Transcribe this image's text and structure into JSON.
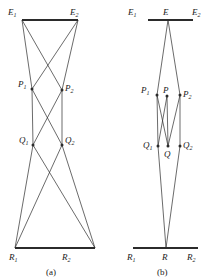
{
  "figure": {
    "background": "#ffffff",
    "ink": "#2b2b2b",
    "panels": [
      {
        "id": "a",
        "caption": "(a)",
        "caption_x": 46,
        "caption_y": 268,
        "bars": [
          {
            "name": "E-bar",
            "x1": 22,
            "y1": 20,
            "x2": 78,
            "y2": 20
          },
          {
            "name": "R-bar",
            "x1": 15,
            "y1": 248,
            "x2": 95,
            "y2": 248
          }
        ],
        "nodes": [
          {
            "label": "E",
            "sub": "1",
            "x": 22,
            "y": 20,
            "dot": false,
            "lx": 8,
            "ly": 8
          },
          {
            "label": "E",
            "sub": "2",
            "x": 78,
            "y": 20,
            "dot": false,
            "lx": 70,
            "ly": 8
          },
          {
            "label": "P",
            "sub": "1",
            "x": 32,
            "y": 89,
            "dot": true,
            "lx": 18,
            "ly": 80
          },
          {
            "label": "P",
            "sub": "2",
            "x": 62,
            "y": 90,
            "dot": true,
            "lx": 65,
            "ly": 84
          },
          {
            "label": "Q",
            "sub": "1",
            "x": 33,
            "y": 145,
            "dot": true,
            "lx": 19,
            "ly": 136
          },
          {
            "label": "Q",
            "sub": "2",
            "x": 62,
            "y": 145,
            "dot": true,
            "lx": 65,
            "ly": 136
          },
          {
            "label": "R",
            "sub": "1",
            "x": 15,
            "y": 248,
            "dot": false,
            "lx": 9,
            "ly": 253
          },
          {
            "label": "R",
            "sub": "2",
            "x": 95,
            "y": 248,
            "dot": false,
            "lx": 62,
            "ly": 253
          }
        ],
        "edges": [
          {
            "from": "E1",
            "to": "P1",
            "x1": 22,
            "y1": 20,
            "x2": 32,
            "y2": 89
          },
          {
            "from": "E1",
            "to": "P2",
            "x1": 22,
            "y1": 20,
            "x2": 62,
            "y2": 90
          },
          {
            "from": "E2",
            "to": "P1",
            "x1": 78,
            "y1": 20,
            "x2": 32,
            "y2": 89
          },
          {
            "from": "E2",
            "to": "P2",
            "x1": 78,
            "y1": 20,
            "x2": 62,
            "y2": 90
          },
          {
            "from": "P1",
            "to": "Q1",
            "x1": 32,
            "y1": 89,
            "x2": 33,
            "y2": 145
          },
          {
            "from": "P1",
            "to": "Q2",
            "x1": 32,
            "y1": 89,
            "x2": 62,
            "y2": 145
          },
          {
            "from": "P2",
            "to": "Q1",
            "x1": 62,
            "y1": 90,
            "x2": 33,
            "y2": 145
          },
          {
            "from": "P2",
            "to": "Q2",
            "x1": 62,
            "y1": 90,
            "x2": 62,
            "y2": 145
          },
          {
            "from": "Q1",
            "to": "R1",
            "x1": 33,
            "y1": 145,
            "x2": 15,
            "y2": 248
          },
          {
            "from": "Q1",
            "to": "R2",
            "x1": 33,
            "y1": 145,
            "x2": 95,
            "y2": 248
          },
          {
            "from": "Q2",
            "to": "R1",
            "x1": 62,
            "y1": 145,
            "x2": 15,
            "y2": 248
          },
          {
            "from": "Q2",
            "to": "R2",
            "x1": 62,
            "y1": 145,
            "x2": 95,
            "y2": 248
          }
        ]
      },
      {
        "id": "b",
        "caption": "(b)",
        "caption_x": 157,
        "caption_y": 268,
        "bars": [
          {
            "name": "E-bar",
            "x1": 148,
            "y1": 20,
            "x2": 193,
            "y2": 20
          },
          {
            "name": "R-bar",
            "x1": 133,
            "y1": 248,
            "x2": 198,
            "y2": 248
          }
        ],
        "nodes": [
          {
            "label": "E",
            "sub": "1",
            "x": 148,
            "y": 20,
            "dot": false,
            "lx": 128,
            "ly": 8
          },
          {
            "label": "E",
            "sub": "",
            "x": 168,
            "y": 20,
            "dot": false,
            "lx": 163,
            "ly": 8
          },
          {
            "label": "E",
            "sub": "2",
            "x": 193,
            "y": 20,
            "dot": false,
            "lx": 192,
            "ly": 8
          },
          {
            "label": "P",
            "sub": "1",
            "x": 157,
            "y": 95,
            "dot": true,
            "lx": 141,
            "ly": 86
          },
          {
            "label": "P",
            "sub": "",
            "x": 167,
            "y": 96,
            "dot": true,
            "lx": 163,
            "ly": 86
          },
          {
            "label": "P",
            "sub": "2",
            "x": 180,
            "y": 95,
            "dot": true,
            "lx": 183,
            "ly": 90
          },
          {
            "label": "Q",
            "sub": "1",
            "x": 158,
            "y": 146,
            "dot": true,
            "lx": 143,
            "ly": 141
          },
          {
            "label": "Q",
            "sub": "",
            "x": 168,
            "y": 146,
            "dot": true,
            "lx": 164,
            "ly": 150
          },
          {
            "label": "Q",
            "sub": "2",
            "x": 180,
            "y": 146,
            "dot": true,
            "lx": 183,
            "ly": 141
          },
          {
            "label": "R",
            "sub": "1",
            "x": 133,
            "y": 248,
            "dot": false,
            "lx": 127,
            "ly": 253
          },
          {
            "label": "R",
            "sub": "",
            "x": 166,
            "y": 248,
            "dot": false,
            "lx": 162,
            "ly": 253
          },
          {
            "label": "R",
            "sub": "2",
            "x": 198,
            "y": 248,
            "dot": false,
            "lx": 187,
            "ly": 253
          }
        ],
        "edges": [
          {
            "from": "E",
            "to": "P1",
            "x1": 168,
            "y1": 20,
            "x2": 157,
            "y2": 95
          },
          {
            "from": "E",
            "to": "P2",
            "x1": 168,
            "y1": 20,
            "x2": 180,
            "y2": 95
          },
          {
            "from": "P1",
            "to": "Q1",
            "x1": 157,
            "y1": 95,
            "x2": 158,
            "y2": 146
          },
          {
            "from": "P1",
            "to": "Q",
            "x1": 157,
            "y1": 95,
            "x2": 168,
            "y2": 146
          },
          {
            "from": "P",
            "to": "Q1",
            "x1": 167,
            "y1": 96,
            "x2": 158,
            "y2": 146
          },
          {
            "from": "P",
            "to": "Q",
            "x1": 167,
            "y1": 96,
            "x2": 168,
            "y2": 146
          },
          {
            "from": "P2",
            "to": "Q",
            "x1": 180,
            "y1": 95,
            "x2": 168,
            "y2": 146
          },
          {
            "from": "P2",
            "to": "Q2",
            "x1": 180,
            "y1": 95,
            "x2": 180,
            "y2": 146
          },
          {
            "from": "Q1",
            "to": "R",
            "x1": 158,
            "y1": 146,
            "x2": 166,
            "y2": 248
          },
          {
            "from": "Q2",
            "to": "R",
            "x1": 180,
            "y1": 146,
            "x2": 166,
            "y2": 248
          }
        ]
      }
    ]
  }
}
